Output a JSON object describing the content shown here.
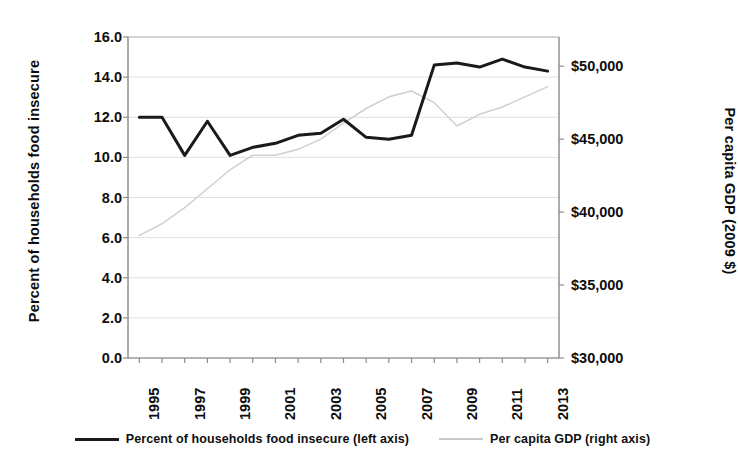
{
  "chart_data": {
    "type": "line",
    "title": "",
    "xlabel": "",
    "ylabel": "Percent of households food insecure",
    "y2label": "Per capita GDP (2009 $)",
    "grid": true,
    "legend_position": "bottom",
    "x": [
      1995,
      1996,
      1997,
      1998,
      1999,
      2000,
      2001,
      2002,
      2003,
      2004,
      2005,
      2006,
      2007,
      2008,
      2009,
      2010,
      2011,
      2012,
      2013
    ],
    "xtick_labels": [
      "1995",
      "1997",
      "1999",
      "2001",
      "2003",
      "2005",
      "2007",
      "2009",
      "2011",
      "2013"
    ],
    "xtick_values": [
      1995,
      1997,
      1999,
      2001,
      2003,
      2005,
      2007,
      2009,
      2011,
      2013
    ],
    "xlim": [
      1994.5,
      2013.5
    ],
    "ylim": [
      0.0,
      16.0
    ],
    "ytick_labels": [
      "0.0",
      "2.0",
      "4.0",
      "6.0",
      "8.0",
      "10.0",
      "12.0",
      "14.0",
      "16.0"
    ],
    "ytick_values": [
      0.0,
      2.0,
      4.0,
      6.0,
      8.0,
      10.0,
      12.0,
      14.0,
      16.0
    ],
    "y2lim": [
      30000,
      52000
    ],
    "y2tick_labels": [
      "$30,000",
      "$35,000",
      "$40,000",
      "$45,000",
      "$50,000"
    ],
    "y2tick_values": [
      30000,
      35000,
      40000,
      45000,
      50000
    ],
    "series": [
      {
        "name": "Percent of households food insecure (left axis)",
        "axis": "left",
        "color": "#1a1a1a",
        "width": 3.0,
        "values": [
          12.0,
          12.0,
          10.1,
          11.8,
          10.1,
          10.5,
          10.7,
          11.1,
          11.2,
          11.9,
          11.0,
          10.9,
          11.1,
          14.6,
          14.7,
          14.5,
          14.9,
          14.5,
          14.3
        ]
      },
      {
        "name": "Per capita GDP (right axis)",
        "axis": "right",
        "color": "#cfcfcf",
        "width": 1.5,
        "values": [
          38400,
          39200,
          40300,
          41600,
          42900,
          43900,
          43900,
          44300,
          45000,
          46100,
          47100,
          47900,
          48300,
          47500,
          45900,
          46700,
          47200,
          47900,
          48600
        ]
      }
    ]
  },
  "legend": {
    "items": [
      {
        "label": "Percent of households food insecure (left axis)",
        "style": "solid"
      },
      {
        "label": "Per capita GDP (right axis)",
        "style": "faint"
      }
    ]
  },
  "colors": {
    "series_primary": "#1a1a1a",
    "series_secondary": "#cfcfcf",
    "grid": "#d8d8d8",
    "axis": "#b8b8b8",
    "text": "#0d0d0d",
    "background": "#ffffff"
  }
}
